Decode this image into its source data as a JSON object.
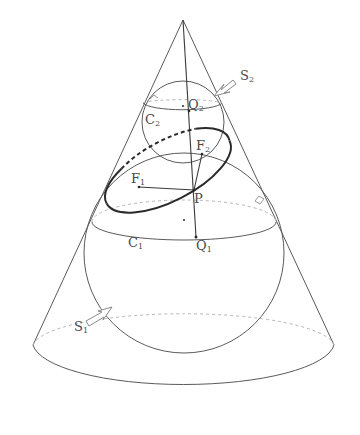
{
  "figure": {
    "colors": {
      "line": "#5a5a5a",
      "ellipse": "#2a2a2a",
      "dashed": "#b5b5b5",
      "text": "#4a4a4a"
    }
  },
  "labels": {
    "S2": {
      "main": "S",
      "sub": "2"
    },
    "S1": {
      "main": "S",
      "sub": "1"
    },
    "Q2": {
      "main": "Q",
      "sub": "2"
    },
    "Q1": {
      "main": "Q",
      "sub": "1"
    },
    "C2": {
      "main": "C",
      "sub": "2"
    },
    "C1": {
      "main": "C",
      "sub": "1"
    },
    "F1": {
      "main": "F",
      "sub": "1"
    },
    "F2": {
      "main": "F",
      "sub": "2"
    },
    "P": {
      "main": "P"
    }
  },
  "points": {
    "apex": [
      183,
      20
    ],
    "Q2": [
      189,
      111
    ],
    "Q1": [
      196,
      237
    ],
    "F1": [
      139,
      187
    ],
    "F2": [
      202,
      154
    ],
    "P": [
      194,
      190
    ],
    "upper_sphere_center": [
      183,
      106
    ],
    "lower_sphere_center": [
      184,
      220
    ]
  }
}
